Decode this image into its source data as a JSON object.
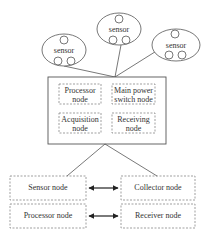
{
  "diagram": {
    "sensors": [
      {
        "label": "sensor"
      },
      {
        "label": "sensor"
      },
      {
        "label": "sensor"
      }
    ],
    "hub": {
      "nodes": [
        {
          "line1": "Processor",
          "line2": "node"
        },
        {
          "line1": "Main power",
          "line2": "switch node"
        },
        {
          "line1": "Acquisition",
          "line2": "node"
        },
        {
          "line1": "Receiving",
          "line2": "node"
        }
      ]
    },
    "bottom": {
      "left": [
        {
          "label": "Sensor node"
        },
        {
          "label": "Processor node"
        }
      ],
      "right": [
        {
          "label": "Collector node"
        },
        {
          "label": "Receiver node"
        }
      ],
      "connector": "bidirectional-arrow"
    },
    "colors": {
      "stroke": "#555555",
      "dashed": "#777777",
      "text": "#333333",
      "arrow": "#222222"
    }
  }
}
